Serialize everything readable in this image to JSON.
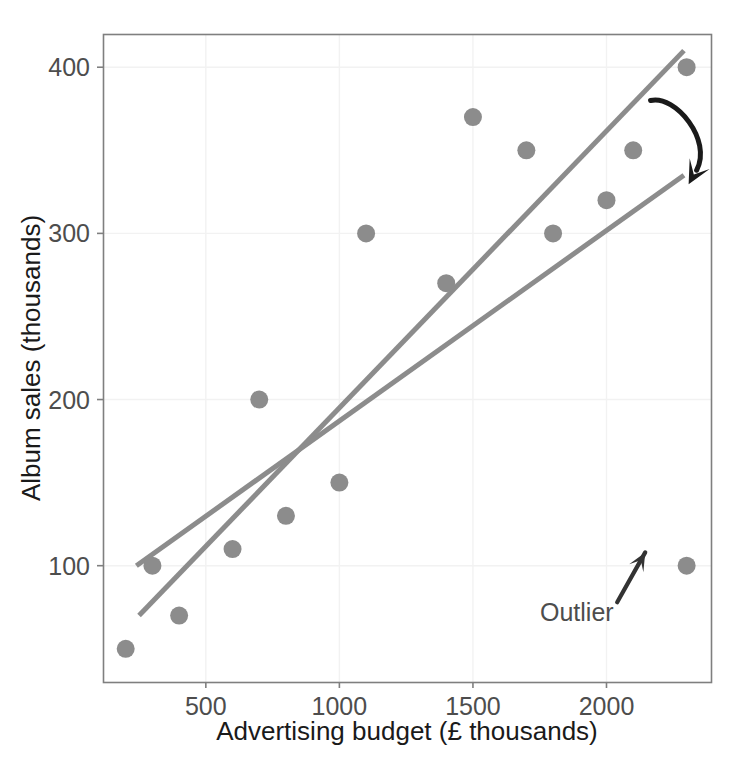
{
  "chart_data": {
    "type": "scatter",
    "title": "",
    "subtitle": "",
    "xlabel": "Advertising budget (£ thousands)",
    "ylabel": "Album sales (thousands)",
    "xlim": [
      115,
      2395
    ],
    "ylim": [
      30,
      420
    ],
    "xticks": [
      500,
      1000,
      1500,
      2000
    ],
    "xtick_labels": [
      "500",
      "1000",
      "1500",
      "2000"
    ],
    "yticks": [
      100,
      200,
      300,
      400
    ],
    "ytick_labels": [
      "100",
      "200",
      "300",
      "400"
    ],
    "grid": true,
    "grid_color": "#f2f2f2",
    "legend": "none",
    "point_color": "#8c8c8c",
    "point_radius": 9,
    "points": [
      {
        "x": 200,
        "y": 50
      },
      {
        "x": 300,
        "y": 100
      },
      {
        "x": 400,
        "y": 70
      },
      {
        "x": 600,
        "y": 110
      },
      {
        "x": 700,
        "y": 200
      },
      {
        "x": 800,
        "y": 130
      },
      {
        "x": 1000,
        "y": 150
      },
      {
        "x": 1100,
        "y": 300
      },
      {
        "x": 1400,
        "y": 270
      },
      {
        "x": 1500,
        "y": 370
      },
      {
        "x": 1700,
        "y": 350
      },
      {
        "x": 1800,
        "y": 300
      },
      {
        "x": 2000,
        "y": 320
      },
      {
        "x": 2100,
        "y": 350
      },
      {
        "x": 2300,
        "y": 400
      },
      {
        "x": 2300,
        "y": 100
      }
    ],
    "series": [
      {
        "name": "regression-line-steep",
        "type": "line",
        "color": "#8c8c8c",
        "width": 5,
        "x": [
          250,
          2290
        ],
        "y": [
          70,
          410
        ]
      },
      {
        "name": "regression-line-shallow",
        "type": "line",
        "color": "#8c8c8c",
        "width": 5,
        "x": [
          240,
          2290
        ],
        "y": [
          100,
          335
        ]
      }
    ],
    "annotations": [
      {
        "name": "outlier-label",
        "text": "Outlier",
        "x": 1950,
        "y": 62,
        "color": "#4d4d4d"
      },
      {
        "name": "outlier-arrow",
        "type": "straight-arrow",
        "from": {
          "x": 2040,
          "y": 78
        },
        "to": {
          "x": 2145,
          "y": 108
        },
        "color": "#333333"
      },
      {
        "name": "line-shift-arrow",
        "type": "curved-arrow",
        "from": {
          "x": 2165,
          "y": 380
        },
        "to": {
          "x": 2315,
          "y": 332
        },
        "color": "#1a1a1a"
      }
    ]
  },
  "axes": {
    "panel_border_color": "#7f7f7f",
    "x_tick_labels": [
      "500",
      "1000",
      "1500",
      "2000"
    ],
    "y_tick_labels": [
      "100",
      "200",
      "300",
      "400"
    ],
    "x_axis_title": "Advertising budget (£ thousands)",
    "y_axis_title": "Album sales (thousands)"
  },
  "annotations": {
    "outlier_label": "Outlier"
  }
}
